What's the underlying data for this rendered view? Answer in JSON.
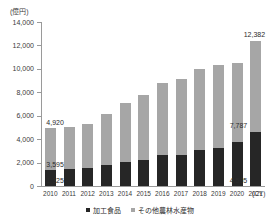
{
  "chart_data": {
    "type": "bar",
    "stacked": true,
    "title": "",
    "subtitle": "",
    "unit_label": "(億円)",
    "xlabel": "(CY)",
    "ylabel": "",
    "ylim": [
      0,
      14000
    ],
    "ytick_values": [
      0,
      2000,
      4000,
      6000,
      8000,
      10000,
      12000,
      14000
    ],
    "ytick_labels": [
      "0",
      "2,000",
      "4,000",
      "6,000",
      "8,000",
      "10,000",
      "12,000",
      "14,000"
    ],
    "grid": false,
    "legend_position": "bottom",
    "categories": [
      "2010",
      "2011",
      "2012",
      "2013",
      "2014",
      "2015",
      "2016",
      "2017",
      "2018",
      "2019",
      "2020",
      "2021"
    ],
    "series": [
      {
        "name": "加工食品",
        "color": "#262626",
        "values": [
          1325,
          1450,
          1510,
          1790,
          2050,
          2220,
          2640,
          2636,
          3060,
          3271,
          3740,
          4595
        ]
      },
      {
        "name": "その他農林水産物",
        "color": "#a6a6a6",
        "values": [
          3595,
          3570,
          3790,
          4350,
          5050,
          5530,
          6120,
          6484,
          6940,
          7030,
          6800,
          7787
        ]
      }
    ],
    "totals": [
      4920,
      5020,
      5300,
      6140,
      7100,
      7750,
      8760,
      9120,
      10000,
      10301,
      10540,
      12382
    ],
    "annotations": [
      {
        "category": "2010",
        "text": "4,920",
        "kind": "total"
      },
      {
        "category": "2010",
        "text": "3,595",
        "kind": "other-agriculture"
      },
      {
        "category": "2010",
        "text": "1,325",
        "kind": "processed-food"
      },
      {
        "category": "2021",
        "text": "12,382",
        "kind": "total"
      },
      {
        "category": "2021",
        "text": "7,787",
        "kind": "other-agriculture"
      },
      {
        "category": "2021",
        "text": "4,595",
        "kind": "processed-food"
      }
    ]
  },
  "labels": {
    "unit": "(億円)",
    "cy": "(CY)",
    "y_0": "0",
    "y_2000": "2,000",
    "y_4000": "4,000",
    "y_6000": "6,000",
    "y_8000": "8,000",
    "y_10000": "10,000",
    "y_12000": "12,000",
    "y_14000": "14,000",
    "x_2010": "2010",
    "x_2011": "2011",
    "x_2012": "2012",
    "x_2013": "2013",
    "x_2014": "2014",
    "x_2015": "2015",
    "x_2016": "2016",
    "x_2017": "2017",
    "x_2018": "2018",
    "x_2019": "2019",
    "x_2020": "2020",
    "x_2021": "2021",
    "v_2010_total": "4,920",
    "v_2010_gray": "3,595",
    "v_2010_dark": "1,325",
    "v_2021_total": "12,382",
    "v_2021_gray": "7,787",
    "v_2021_dark": "4,595"
  },
  "legend": {
    "processed_food": "加工食品",
    "other_agriculture": "その他農林水産物"
  },
  "colors": {
    "processed_food": "#262626",
    "other_agriculture": "#a6a6a6",
    "axis": "#9a9a9a",
    "text": "#2b2b2b"
  }
}
